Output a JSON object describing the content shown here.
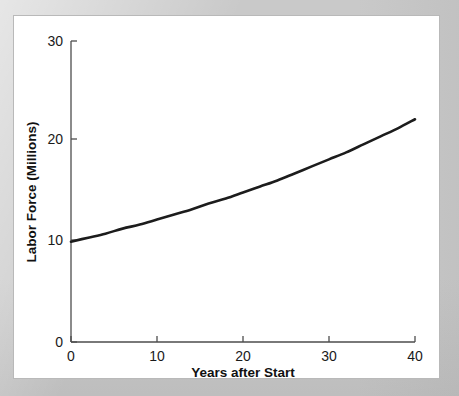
{
  "figure": {
    "background_color": "#c9c9c9",
    "panel_color": "#ffffff",
    "panel_border_color": "#b9b9b9"
  },
  "chart_data": {
    "type": "line",
    "title": "",
    "subtitle": "",
    "xlabel": "Years after Start",
    "ylabel": "Labor Force (Millions)",
    "xlim": [
      0,
      40
    ],
    "ylim": [
      0,
      30
    ],
    "xticks": [
      0,
      10,
      20,
      30,
      40
    ],
    "xtick_labels": [
      "0",
      "10",
      "20",
      "30",
      "40"
    ],
    "yticks": [
      0,
      10,
      20,
      30
    ],
    "ytick_labels": [
      "0",
      "10",
      "20",
      "30"
    ],
    "grid": false,
    "legend": false,
    "legend_position": "none",
    "series": [
      {
        "name": "Labor Force",
        "color": "#1c1c1c",
        "line_width": 2.6,
        "x": [
          0,
          2,
          4,
          6,
          8,
          10,
          12,
          14,
          16,
          18,
          20,
          22,
          24,
          26,
          28,
          30,
          32,
          34,
          36,
          38,
          40
        ],
        "values": [
          10.0,
          10.4,
          10.8,
          11.3,
          11.7,
          12.2,
          12.7,
          13.2,
          13.8,
          14.3,
          14.9,
          15.5,
          16.1,
          16.8,
          17.5,
          18.2,
          18.9,
          19.7,
          20.5,
          21.3,
          22.2
        ]
      }
    ],
    "annotations": []
  },
  "axes": {
    "x_axis_name": "x-axis",
    "y_axis_name": "y-axis",
    "x_title": "Years after Start",
    "y_title": "Labor Force (Millions)"
  }
}
